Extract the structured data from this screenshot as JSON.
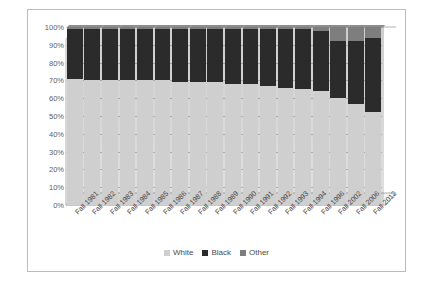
{
  "chart_data": {
    "type": "bar",
    "title": "",
    "subtitle": "",
    "xlabel": "",
    "ylabel": "",
    "stacked": true,
    "stack_total": 100,
    "grid": true,
    "legend_position": "bottom",
    "ylim": [
      0,
      100
    ],
    "ytick_labels": [
      "100%",
      "90%",
      "80%",
      "70%",
      "60%",
      "50%",
      "40%",
      "30%",
      "20%",
      "10%",
      "0%"
    ],
    "ytick_values": [
      100,
      90,
      80,
      70,
      60,
      50,
      40,
      30,
      20,
      10,
      0
    ],
    "categories": [
      "Fall 1981",
      "Fall 1982",
      "Fall 1983",
      "Fall 1984",
      "Fall 1985",
      "Fall 1986",
      "Fall 1987",
      "Fall 1988",
      "Fall 1989",
      "Fall 1990",
      "Fall 1991",
      "Fall 1992",
      "Fall 1993",
      "Fall 1994",
      "Fall 1996",
      "Fall 2002",
      "Fall 2006",
      "Fall 2012"
    ],
    "series": [
      {
        "name": "White",
        "color": "#cfcfcf",
        "values": [
          71,
          70,
          70,
          70,
          70,
          70,
          69,
          69,
          69,
          68,
          68,
          67,
          66,
          65,
          64,
          60,
          57,
          52
        ]
      },
      {
        "name": "Black",
        "color": "#2b2b2b",
        "values": [
          28,
          29,
          29,
          29,
          29,
          29,
          30,
          30,
          30,
          31,
          31,
          32,
          33,
          34,
          34,
          32,
          35,
          42
        ]
      },
      {
        "name": "Other",
        "color": "#7e7e7e",
        "values": [
          1,
          1,
          1,
          1,
          1,
          1,
          1,
          1,
          1,
          1,
          1,
          1,
          1,
          1,
          2,
          8,
          8,
          6
        ]
      }
    ]
  },
  "legend": {
    "items": [
      {
        "label": "White",
        "color": "#cfcfcf"
      },
      {
        "label": "Black",
        "color": "#2b2b2b"
      },
      {
        "label": "Other",
        "color": "#7e7e7e"
      }
    ]
  }
}
